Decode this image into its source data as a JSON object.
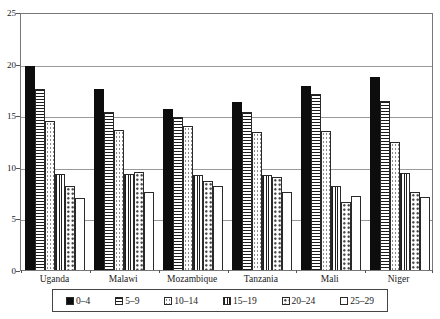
{
  "chart_data": {
    "type": "bar",
    "title": "",
    "xlabel": "",
    "ylabel": "",
    "ylim": [
      0,
      25
    ],
    "yticks": [
      0,
      5,
      10,
      15,
      20,
      25
    ],
    "grid": true,
    "legend_position": "bottom",
    "categories": [
      "Uganda",
      "Malawi",
      "Mozambique",
      "Tanzania",
      "Mali",
      "Niger"
    ],
    "series": [
      {
        "name": "0–4",
        "pattern": "solid-black",
        "values": [
          19.8,
          17.5,
          15.6,
          16.3,
          17.8,
          18.7
        ]
      },
      {
        "name": "5–9",
        "pattern": "h-lines",
        "values": [
          17.5,
          15.3,
          14.8,
          15.3,
          17.1,
          16.4
        ]
      },
      {
        "name": "10–14",
        "pattern": "dots-light",
        "values": [
          14.4,
          13.6,
          14.0,
          13.4,
          13.5,
          12.4
        ]
      },
      {
        "name": "15–19",
        "pattern": "v-lines",
        "values": [
          9.3,
          9.3,
          9.2,
          9.2,
          8.1,
          9.4
        ]
      },
      {
        "name": "20–24",
        "pattern": "dots-dense",
        "values": [
          8.1,
          9.5,
          8.6,
          9.0,
          6.6,
          7.6
        ]
      },
      {
        "name": "25–29",
        "pattern": "white",
        "values": [
          7.0,
          7.6,
          8.1,
          7.6,
          7.2,
          7.1
        ]
      }
    ]
  },
  "colors": {
    "background": "#ffffff",
    "gridline": "#9a9a9a",
    "plot_border": "#777777",
    "bar_fill_black": "#0d0d0d",
    "text": "#1a1a1a"
  }
}
